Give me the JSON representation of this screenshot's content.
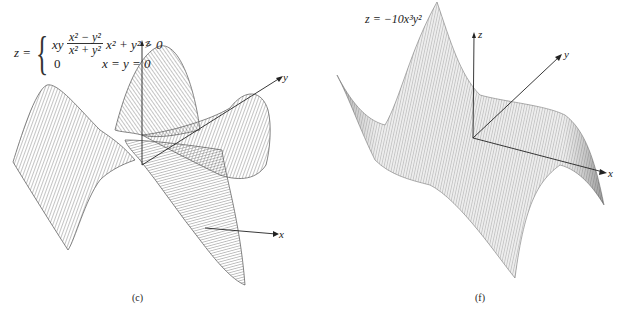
{
  "figure": {
    "panels": [
      {
        "id": "c",
        "caption": "(c)",
        "equation": {
          "lhs": "z =",
          "case1_prefix": "xy",
          "case1_numerator": "x² − y²",
          "case1_denominator": "x² + y²",
          "case1_condition": "x² + y² > 0",
          "case2_value": "0",
          "case2_condition": "x = y = 0"
        },
        "axes": {
          "x": "x",
          "y": "y",
          "z": "z"
        },
        "surface": "z = xy(x² − y²)/(x² + y²), wireframe saddle with four lobes"
      },
      {
        "id": "f",
        "caption": "(f)",
        "equation": {
          "text": "z = −10x³y²"
        },
        "axes": {
          "x": "x",
          "y": "y",
          "z": "z"
        },
        "surface": "z = −10x³y², wireframe monkey-saddle-like surface"
      }
    ],
    "colors": {
      "mesh": "#6a6a6a",
      "mesh_dark": "#444444",
      "axis": "#222222",
      "background": "#ffffff"
    }
  }
}
